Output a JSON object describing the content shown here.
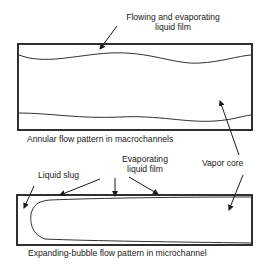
{
  "diagram": {
    "macro": {
      "film_label_line1": "Flowing and evaporating",
      "film_label_line2": "liquid film",
      "caption": "Annular flow pattern in macrochannels"
    },
    "shared": {
      "vapor_core_label": "Vapor core"
    },
    "micro": {
      "slug_label": "Liquid slug",
      "film_label_line1": "Evaporating",
      "film_label_line2": "liquid film",
      "caption": "Expanding-bubble flow pattern in microchannel"
    },
    "colors": {
      "line": "#1a1a1a",
      "background": "#ffffff"
    }
  }
}
